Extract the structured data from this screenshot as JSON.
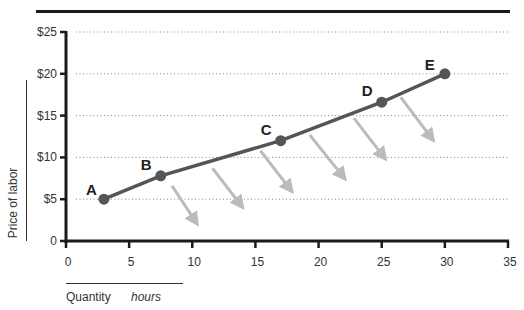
{
  "chart_data": {
    "type": "line",
    "title": "",
    "xlabel": "Quantity",
    "xlabel_unit": "hours",
    "ylabel": "Price of labor",
    "xlim": [
      0,
      35
    ],
    "ylim": [
      0,
      25
    ],
    "x_ticks": [
      "0",
      "5",
      "10",
      "15",
      "20",
      "25",
      "30",
      "35"
    ],
    "y_ticks": [
      "0",
      "$5",
      "$10",
      "$15",
      "$20",
      "$25"
    ],
    "grid": "horizontal dotted",
    "series": [
      {
        "name": "Labor supply",
        "color": "#555555",
        "points": [
          {
            "label": "A",
            "x": 3,
            "y": 5
          },
          {
            "label": "B",
            "x": 7.5,
            "y": 7.8
          },
          {
            "label": "C",
            "x": 17,
            "y": 12
          },
          {
            "label": "D",
            "x": 25,
            "y": 16.6
          },
          {
            "label": "E",
            "x": 30,
            "y": 20
          }
        ]
      }
    ],
    "annotations": [
      {
        "type": "arrow",
        "from": [
          8.4,
          6.6
        ],
        "to": [
          10.4,
          2.0
        ],
        "color": "#bbbbbb"
      },
      {
        "type": "arrow",
        "from": [
          11.6,
          8.7
        ],
        "to": [
          14.0,
          4.0
        ],
        "color": "#bbbbbb"
      },
      {
        "type": "arrow",
        "from": [
          15.4,
          10.8
        ],
        "to": [
          17.9,
          5.9
        ],
        "color": "#bbbbbb"
      },
      {
        "type": "arrow",
        "from": [
          19.3,
          12.7
        ],
        "to": [
          22.1,
          7.4
        ],
        "color": "#bbbbbb"
      },
      {
        "type": "arrow",
        "from": [
          22.8,
          14.7
        ],
        "to": [
          25.3,
          9.8
        ],
        "color": "#bbbbbb"
      },
      {
        "type": "arrow",
        "from": [
          26.5,
          17.2
        ],
        "to": [
          29.1,
          12.0
        ],
        "color": "#bbbbbb"
      }
    ]
  },
  "labels": {
    "ylabel": "Price of labor",
    "xlabel": "Quantity",
    "xunit": "hours"
  }
}
